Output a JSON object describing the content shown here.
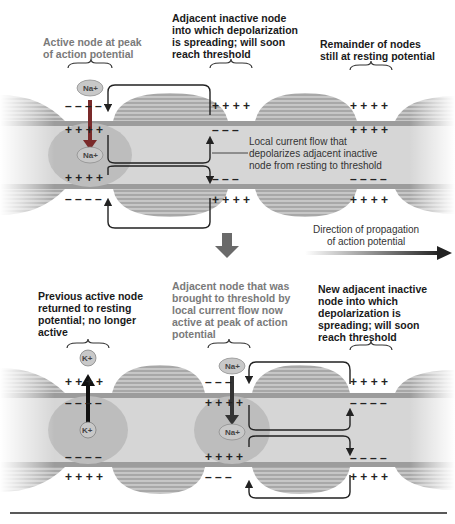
{
  "top_panel": {
    "labels": {
      "active_node": "Active node at peak\nof action potential",
      "adjacent_inactive": "Adjacent inactive node\ninto which depolarization\nis spreading; will soon\nreach threshold",
      "remainder": "Remainder of nodes\nstill at resting potential",
      "local_current": "Local current flow that\ndepolarizes adjacent inactive\nnode from resting to threshold"
    },
    "ions": {
      "na_outside": "Na+",
      "na_inside": "Na+"
    },
    "charges": {
      "plus": "+ + + +",
      "minus": "– – – –",
      "plus3": "+ + +",
      "minus3": "– – –"
    }
  },
  "middle": {
    "direction_label": "Direction of propagation\nof action potential"
  },
  "bottom_panel": {
    "labels": {
      "previous_node": "Previous active node\nreturned to resting\npotential; no longer\nactive",
      "adjacent_now_active": "Adjacent node that was\nbrought to threshold by\nlocal current flow now\nactive at peak of action\npotential",
      "new_adjacent": "New adjacent inactive\nnode into which\ndepolarization is\nspreading; will soon\nreach threshold"
    },
    "ions": {
      "k_outside": "K+",
      "k_inside": "K+",
      "na_outside": "Na+",
      "na_inside": "Na+"
    }
  },
  "colors": {
    "axon_fill": "#d4d4d4",
    "myelin_fill": "#9a9a9a",
    "active_region": "#b8b8b8",
    "arrow": "#333333",
    "block_arrow": "#6a6a6a"
  }
}
